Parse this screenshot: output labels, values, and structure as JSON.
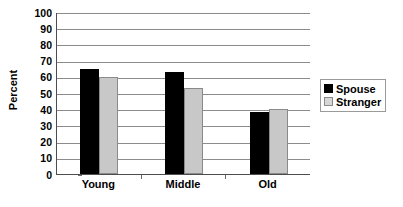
{
  "chart_data": {
    "type": "bar",
    "title": "",
    "xlabel": "",
    "ylabel": "Percent",
    "categories": [
      "Young",
      "Middle",
      "Old"
    ],
    "series": [
      {
        "name": "Spouse",
        "color": "#000000",
        "values": [
          65,
          63,
          38
        ]
      },
      {
        "name": "Stranger",
        "color": "#c8c8c8",
        "values": [
          60,
          53,
          40
        ]
      }
    ],
    "ylim": [
      0,
      100
    ],
    "ytick_step": 10,
    "yticks": [
      0,
      10,
      20,
      30,
      40,
      50,
      60,
      70,
      80,
      90,
      100
    ],
    "ytick_labels": [
      "0",
      "10",
      "20",
      "30",
      "40",
      "50",
      "60",
      "70",
      "80",
      "90",
      "100"
    ],
    "grid": true,
    "grid_axis": "y",
    "legend_position": "right",
    "legend_entries": [
      "Spouse",
      "Stranger"
    ],
    "background_color": "#ffffff",
    "axis_color": "#4d4d4d",
    "gridline_color": "#8c8c8c"
  }
}
